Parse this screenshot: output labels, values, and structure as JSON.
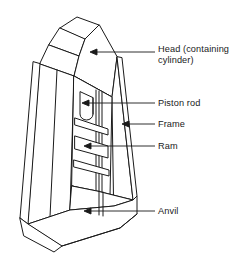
{
  "diagram": {
    "style": {
      "stroke_color": "#1a1a1a",
      "fill_color": "#ffffff",
      "leader_color": "#1a1a1a",
      "background": "#ffffff",
      "line_width": 1
    },
    "callouts": [
      {
        "id": "head",
        "label": "Head (containing\ncylinder)",
        "label_lines": [
          "Head (containing",
          "cylinder)"
        ],
        "text_x": 158,
        "text_y": 44,
        "leader": {
          "x1": 155,
          "y1": 52,
          "x2": 90,
          "y2": 52
        },
        "arrow_at": "left"
      },
      {
        "id": "piston-rod",
        "label": "Piston rod",
        "label_lines": [
          "Piston rod"
        ],
        "text_x": 158,
        "text_y": 98,
        "leader": {
          "x1": 155,
          "y1": 103,
          "x2": 82,
          "y2": 103
        },
        "arrow_at": "left"
      },
      {
        "id": "frame",
        "label": "Frame",
        "label_lines": [
          "Frame"
        ],
        "text_x": 158,
        "text_y": 119,
        "leader": {
          "x1": 155,
          "y1": 124,
          "x2": 122,
          "y2": 124
        },
        "arrow_at": "left"
      },
      {
        "id": "ram",
        "label": "Ram",
        "label_lines": [
          "Ram"
        ],
        "text_x": 158,
        "text_y": 141,
        "leader": {
          "x1": 155,
          "y1": 146,
          "x2": 84,
          "y2": 146
        },
        "arrow_at": "left"
      },
      {
        "id": "anvil",
        "label": "Anvil",
        "label_lines": [
          "Anvil"
        ],
        "text_x": 158,
        "text_y": 206,
        "leader": {
          "x1": 155,
          "y1": 211,
          "x2": 84,
          "y2": 211
        },
        "arrow_at": "left"
      }
    ]
  }
}
